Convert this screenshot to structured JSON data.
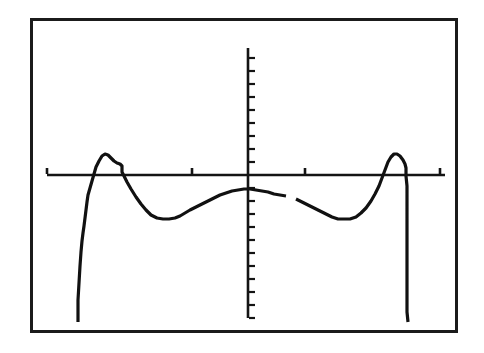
{
  "screen": {
    "width": 484,
    "height": 353,
    "background_color": "#ffffff",
    "frame_color": "#1b1b1b",
    "frame_border_width": 3,
    "frame_rect": {
      "x": 30,
      "y": 18,
      "width": 428,
      "height": 315
    },
    "device_label": "graphing-calculator-screen"
  },
  "chart_data": {
    "type": "line",
    "title": "",
    "subtitle": "",
    "xlabel": "",
    "ylabel": "",
    "legend": [],
    "legend_position": "none",
    "grid": false,
    "axes": {
      "x_axis_visible": true,
      "y_axis_visible": true,
      "x_axis_pixel_y": 175,
      "y_axis_pixel_x": 248,
      "x_axis_pixel_span": [
        47,
        445
      ],
      "y_axis_pixel_span": [
        48,
        318
      ],
      "xlim": [
        -4.0,
        4.0
      ],
      "ylim": [
        -4.0,
        4.0
      ],
      "x_tick_count": 4,
      "y_tick_count": 20,
      "x_tick_pixels": [
        47,
        192,
        305,
        440
      ],
      "y_tick_spacing_pixels": 13,
      "tick_labels_shown": false
    },
    "curve_color": "#111111",
    "curve_stroke_width": 3.2,
    "discontinuity_gap_pixel_x": [
      286,
      296
    ],
    "series": [
      {
        "name": "y1",
        "points_pixel": [
          [
            78,
            322
          ],
          [
            78,
            300
          ],
          [
            79,
            283
          ],
          [
            80,
            266
          ],
          [
            81,
            252
          ],
          [
            82,
            241
          ],
          [
            83,
            233
          ],
          [
            84,
            226
          ],
          [
            85,
            218
          ],
          [
            86,
            210
          ],
          [
            87,
            202
          ],
          [
            88,
            195
          ],
          [
            90,
            188
          ],
          [
            92,
            181
          ],
          [
            94,
            174
          ],
          [
            96,
            167
          ],
          [
            99,
            161
          ],
          [
            102,
            156
          ],
          [
            105,
            154
          ],
          [
            108,
            155
          ],
          [
            111,
            158
          ],
          [
            114,
            161
          ],
          [
            117,
            163
          ],
          [
            120,
            164
          ],
          [
            122,
            166
          ],
          [
            122,
            172
          ],
          [
            124,
            176
          ],
          [
            127,
            182
          ],
          [
            131,
            189
          ],
          [
            136,
            197
          ],
          [
            141,
            204
          ],
          [
            146,
            210
          ],
          [
            151,
            215
          ],
          [
            157,
            218
          ],
          [
            163,
            219
          ],
          [
            169,
            219
          ],
          [
            175,
            218
          ],
          [
            180,
            216
          ],
          [
            185,
            213
          ],
          [
            190,
            210
          ],
          [
            196,
            207
          ],
          [
            202,
            204
          ],
          [
            208,
            201
          ],
          [
            214,
            198
          ],
          [
            220,
            195
          ],
          [
            226,
            193
          ],
          [
            232,
            191
          ],
          [
            238,
            190
          ],
          [
            244,
            189
          ],
          [
            250,
            189
          ],
          [
            256,
            190
          ],
          [
            262,
            191
          ],
          [
            268,
            192
          ],
          [
            274,
            194
          ],
          [
            280,
            195
          ],
          [
            286,
            196
          ]
        ],
        "points_pixel_segment2": [
          [
            296,
            199
          ],
          [
            302,
            202
          ],
          [
            308,
            205
          ],
          [
            314,
            208
          ],
          [
            320,
            211
          ],
          [
            326,
            214
          ],
          [
            332,
            217
          ],
          [
            338,
            219
          ],
          [
            344,
            219
          ],
          [
            350,
            219
          ],
          [
            356,
            217
          ],
          [
            361,
            213
          ],
          [
            366,
            208
          ],
          [
            371,
            201
          ],
          [
            375,
            194
          ],
          [
            379,
            186
          ],
          [
            382,
            178
          ],
          [
            385,
            170
          ],
          [
            388,
            162
          ],
          [
            391,
            157
          ],
          [
            394,
            154
          ],
          [
            397,
            154
          ],
          [
            400,
            156
          ],
          [
            403,
            160
          ],
          [
            405,
            164
          ],
          [
            406,
            168
          ],
          [
            406,
            176
          ],
          [
            407,
            186
          ],
          [
            407,
            196
          ],
          [
            407,
            208
          ],
          [
            407,
            222
          ],
          [
            407,
            238
          ],
          [
            407,
            256
          ],
          [
            407,
            276
          ],
          [
            407,
            296
          ],
          [
            407,
            312
          ],
          [
            408,
            322
          ]
        ],
        "shape_description": "symmetric M-like curve with two sharp peaks above the x-axis, two broad troughs below, a shallow central hump, and steep near-vertical tails at both ends",
        "features": {
          "left_tail_pixel_x": 78,
          "right_tail_pixel_x": 407,
          "tail_bottom_pixel_y": 322,
          "left_peak_pixel": [
            105,
            154
          ],
          "right_peak_pixel": [
            396,
            154
          ],
          "left_trough_pixel": [
            165,
            219
          ],
          "right_trough_pixel": [
            345,
            219
          ],
          "center_hump_pixel": [
            248,
            189
          ]
        }
      }
    ]
  }
}
